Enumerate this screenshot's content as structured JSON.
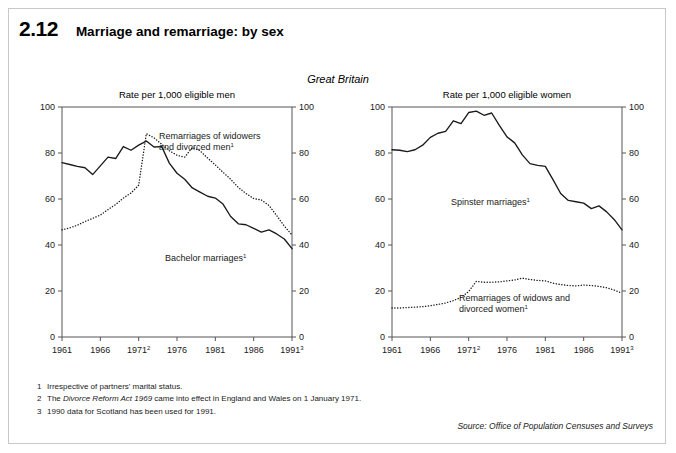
{
  "figure": {
    "number": "2.12",
    "title": "Marriage and remarriage: by sex",
    "region": "Great Britain"
  },
  "footnotes": [
    {
      "num": "1",
      "text_before": "Irrespective of partners' marital status.",
      "italic": "",
      "text_after": ""
    },
    {
      "num": "2",
      "text_before": "The ",
      "italic": "Divorce Reform Act 1969",
      "text_after": " came into effect in England and Wales on 1 January 1971."
    },
    {
      "num": "3",
      "text_before": "1990 data for Scotland has been used for 1991.",
      "italic": "",
      "text_after": ""
    }
  ],
  "source": "Source: Office of Population Censuses and Surveys",
  "chart_data": [
    {
      "type": "line",
      "panel": "men",
      "title": "Rate per 1,000 eligible men",
      "xlabel": "",
      "ylabel": "",
      "xlim": [
        1961,
        1991
      ],
      "ylim": [
        0,
        100
      ],
      "yticks": [
        0,
        20,
        40,
        60,
        80,
        100
      ],
      "xticks": [
        1961,
        1966,
        1971,
        1976,
        1981,
        1986,
        1991
      ],
      "xtick_labels": [
        "1961",
        "1966",
        "1971",
        "1976",
        "1981",
        "1986",
        "1991"
      ],
      "xtick_superscripts": [
        "",
        "",
        "2",
        "",
        "",
        "",
        "3"
      ],
      "grid": false,
      "legend_position": "inline-annotation",
      "x": [
        1961,
        1962,
        1963,
        1964,
        1965,
        1966,
        1967,
        1968,
        1969,
        1970,
        1971,
        1972,
        1973,
        1974,
        1975,
        1976,
        1977,
        1978,
        1979,
        1980,
        1981,
        1982,
        1983,
        1984,
        1985,
        1986,
        1987,
        1988,
        1989,
        1990,
        1991
      ],
      "series": [
        {
          "name": "Bachelor marriages",
          "style": "solid",
          "annotation": "Bachelor marriages",
          "annotation_superscript": "1",
          "values": [
            75.8,
            75.0,
            74.2,
            73.6,
            70.6,
            74.4,
            78.2,
            77.6,
            82.8,
            81.2,
            83.4,
            85.2,
            82.6,
            82.8,
            75.6,
            71.2,
            68.6,
            64.8,
            63.0,
            61.2,
            60.4,
            57.8,
            52.4,
            49.2,
            48.8,
            47.2,
            45.6,
            46.6,
            44.8,
            42.6,
            38.4
          ]
        },
        {
          "name": "Remarriages of widowers and divorced men",
          "style": "dotted",
          "annotation": "Remarriages of widowers and divorced men",
          "annotation_superscript": "1",
          "values": [
            46.6,
            47.4,
            48.6,
            50.2,
            51.6,
            53.0,
            55.4,
            57.6,
            60.4,
            62.6,
            66.0,
            88.4,
            86.6,
            83.8,
            81.0,
            79.0,
            78.2,
            82.4,
            81.0,
            77.8,
            74.8,
            71.6,
            68.6,
            65.0,
            62.4,
            60.2,
            59.6,
            57.2,
            52.8,
            48.2,
            44.4
          ]
        }
      ]
    },
    {
      "type": "line",
      "panel": "women",
      "title": "Rate per 1,000 eligible women",
      "xlabel": "",
      "ylabel": "",
      "xlim": [
        1961,
        1991
      ],
      "ylim": [
        0,
        100
      ],
      "yticks": [
        0,
        20,
        40,
        60,
        80,
        100
      ],
      "xticks": [
        1961,
        1966,
        1971,
        1976,
        1981,
        1986,
        1991
      ],
      "xtick_labels": [
        "1961",
        "1966",
        "1971",
        "1976",
        "1981",
        "1986",
        "1991"
      ],
      "xtick_superscripts": [
        "",
        "",
        "2",
        "",
        "",
        "",
        "3"
      ],
      "grid": false,
      "legend_position": "inline-annotation",
      "x": [
        1961,
        1962,
        1963,
        1964,
        1965,
        1966,
        1967,
        1968,
        1969,
        1970,
        1971,
        1972,
        1973,
        1974,
        1975,
        1976,
        1977,
        1978,
        1979,
        1980,
        1981,
        1982,
        1983,
        1984,
        1985,
        1986,
        1987,
        1988,
        1989,
        1990,
        1991
      ],
      "series": [
        {
          "name": "Spinster marriages",
          "style": "solid",
          "annotation": "Spinster marriages",
          "annotation_superscript": "1",
          "values": [
            81.4,
            81.2,
            80.6,
            81.4,
            83.4,
            86.8,
            88.6,
            89.4,
            94.0,
            92.8,
            97.6,
            98.2,
            96.4,
            97.4,
            92.0,
            87.0,
            84.4,
            79.2,
            75.4,
            74.6,
            74.2,
            68.4,
            62.4,
            59.4,
            58.8,
            58.2,
            55.8,
            57.0,
            54.4,
            51.0,
            46.6
          ]
        },
        {
          "name": "Remarriages of widows and divorced women",
          "style": "dotted",
          "annotation": "Remarriages of widows and divorced women",
          "annotation_superscript": "1",
          "values": [
            12.6,
            12.6,
            12.8,
            13.0,
            13.2,
            13.6,
            14.2,
            14.8,
            15.8,
            17.2,
            19.8,
            24.2,
            23.8,
            23.8,
            24.0,
            24.4,
            24.8,
            25.6,
            25.0,
            24.6,
            24.4,
            23.4,
            22.8,
            22.4,
            22.2,
            22.6,
            22.4,
            22.0,
            21.4,
            20.4,
            19.0
          ]
        }
      ]
    }
  ]
}
